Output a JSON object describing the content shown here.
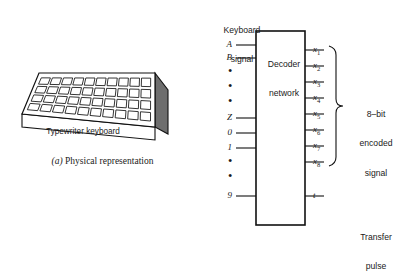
{
  "figure": {
    "parts": [
      {
        "id": "a",
        "caption_label": "(a)",
        "caption_text": "Physical representation"
      }
    ]
  },
  "physical": {
    "device_label": "Typewriter keyboard",
    "keyboard_rows": 4,
    "keyboard_cols": 10,
    "caption_label": "(a)",
    "caption_text": "Physical representation"
  },
  "decoder": {
    "input_group_label": "Keyboard\nsignal",
    "input_group_label_line1": "Keyboard",
    "input_group_label_line2": "signal",
    "box_label_line1": "Decoder",
    "box_label_line2": "network",
    "inputs": [
      {
        "label": "A",
        "type": "signal"
      },
      {
        "label": "B",
        "type": "signal"
      },
      {
        "label": "•",
        "type": "ellipsis"
      },
      {
        "label": "•",
        "type": "ellipsis"
      },
      {
        "label": "•",
        "type": "ellipsis"
      },
      {
        "label": "Z",
        "type": "signal"
      },
      {
        "label": "0",
        "type": "signal"
      },
      {
        "label": "1",
        "type": "signal"
      },
      {
        "label": "•",
        "type": "ellipsis"
      },
      {
        "label": "•",
        "type": "ellipsis"
      },
      {
        "label": "9",
        "type": "signal"
      }
    ],
    "outputs": [
      {
        "base": "x",
        "sub": "1"
      },
      {
        "base": "x",
        "sub": "2"
      },
      {
        "base": "x",
        "sub": "3"
      },
      {
        "base": "x",
        "sub": "4"
      },
      {
        "base": "x",
        "sub": "5"
      },
      {
        "base": "x",
        "sub": "6"
      },
      {
        "base": "x",
        "sub": "7"
      },
      {
        "base": "x",
        "sub": "8"
      }
    ],
    "transfer_output": {
      "base": "t",
      "sub": ""
    },
    "encoded_label_line1": "8–bit",
    "encoded_label_line2": "encoded",
    "encoded_label_line3": "signal",
    "transfer_label_line1": "Transfer",
    "transfer_label_line2": "pulse"
  },
  "colors": {
    "ink": "#1a1a1a",
    "paper": "#ffffff",
    "key_fill": "#f2f2f2",
    "side_fill": "#5a5a5a",
    "top_fill": "#cfcfcf"
  }
}
